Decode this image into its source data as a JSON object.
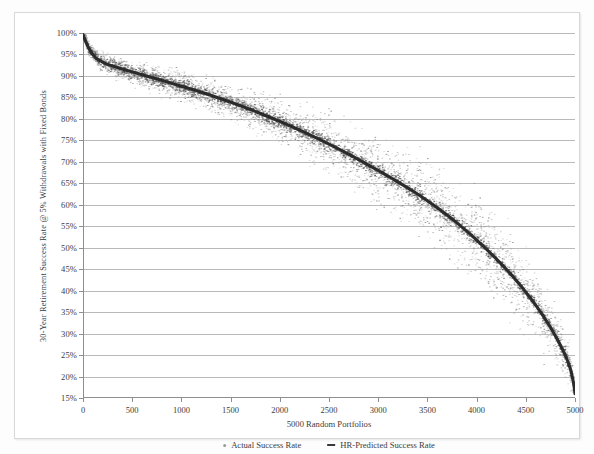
{
  "chart_data": {
    "type": "scatter",
    "title": "",
    "xlabel": "5000 Random Portfolios",
    "ylabel": "30-Year Retirement Success Rate @ 5% Withdrawals with Fixed Bonds",
    "xlim": [
      0,
      5000
    ],
    "ylim": [
      15,
      100
    ],
    "grid": true,
    "legend_position": "bottom",
    "xticks": [
      0,
      500,
      1000,
      1500,
      2000,
      2500,
      3000,
      3500,
      4000,
      4500,
      5000
    ],
    "xtick_labels": [
      "0",
      "500",
      "1000",
      "1500",
      "2000",
      "2500",
      "3000",
      "3500",
      "4000",
      "4500",
      "5000"
    ],
    "yticks": [
      15,
      20,
      25,
      30,
      35,
      40,
      45,
      50,
      55,
      60,
      65,
      70,
      75,
      80,
      85,
      90,
      95,
      100
    ],
    "ytick_labels": [
      "15%",
      "20%",
      "25%",
      "30%",
      "35%",
      "40%",
      "45%",
      "50%",
      "55%",
      "60%",
      "65%",
      "70%",
      "75%",
      "80%",
      "85%",
      "90%",
      "95%",
      "100%"
    ],
    "series": [
      {
        "name": "Actual Success Rate",
        "marker": "dot",
        "color": "#9a9a9a",
        "note": "Scattered cloud of HR-predicted values dispersed around the sorted actual curve",
        "x": [
          0,
          60,
          130,
          220,
          330,
          460,
          610,
          780,
          960,
          1150,
          1350,
          1560,
          1780,
          2000,
          2230,
          2460,
          2690,
          2920,
          3150,
          3380,
          3600,
          3810,
          4010,
          4200,
          4380,
          4540,
          4680,
          4800,
          4890,
          4950,
          4985,
          5000
        ],
        "y": [
          99.6,
          96.4,
          94.2,
          93.0,
          92.1,
          91.2,
          90.2,
          89.1,
          87.9,
          86.6,
          85.1,
          83.4,
          81.5,
          79.4,
          77.1,
          74.6,
          71.9,
          69.0,
          66.0,
          62.8,
          59.3,
          55.6,
          51.6,
          47.4,
          43.0,
          38.5,
          34.0,
          29.5,
          25.5,
          22.0,
          18.5,
          16.0
        ]
      },
      {
        "name": "HR-Predicted Success Rate",
        "marker": "line",
        "color": "#2b2b2b",
        "x": [
          0,
          60,
          130,
          220,
          330,
          460,
          610,
          780,
          960,
          1150,
          1350,
          1560,
          1780,
          2000,
          2230,
          2460,
          2690,
          2920,
          3150,
          3380,
          3600,
          3810,
          4010,
          4200,
          4380,
          4540,
          4680,
          4800,
          4890,
          4950,
          4985,
          5000
        ],
        "y": [
          99.6,
          96.4,
          94.2,
          93.0,
          92.1,
          91.2,
          90.2,
          89.1,
          87.9,
          86.6,
          85.1,
          83.4,
          81.5,
          79.4,
          77.1,
          74.6,
          71.9,
          69.0,
          66.0,
          62.8,
          59.3,
          55.6,
          51.6,
          47.4,
          43.0,
          38.5,
          34.0,
          29.5,
          25.5,
          22.0,
          18.5,
          16.0
        ]
      }
    ],
    "legend": [
      "Actual Success Rate",
      "HR-Predicted Success Rate"
    ]
  }
}
